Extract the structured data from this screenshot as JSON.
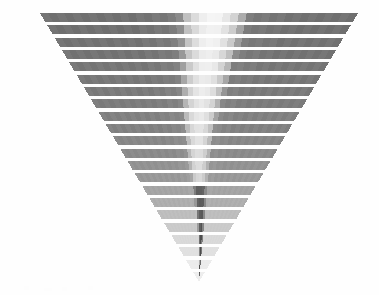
{
  "figure": {
    "title": "",
    "background_color": "#fefefe",
    "width": 379,
    "height": 295
  },
  "chart_data": {
    "type": "heatmap",
    "title": "",
    "subtitle": "",
    "xlabel": "",
    "ylabel": "",
    "grid": false,
    "legend": null,
    "legend_position": "none",
    "geometry": {
      "shape": "inverted-triangle",
      "apex_x": 199,
      "apex_y": 282,
      "top_left_x": 40,
      "top_right_x": 358,
      "top_y": 13,
      "row_count": 22,
      "row_pitch": 12.3,
      "row_fill_ratio": 0.7,
      "cells_per_row": 40
    },
    "curve": {
      "name": "light-sweep-band",
      "description": "Light low-value band curving from upper-centre to the apex",
      "control_points": [
        [
          0.0,
          0.545,
          0.115
        ],
        [
          0.12,
          0.535,
          0.11
        ],
        [
          0.25,
          0.512,
          0.1
        ],
        [
          0.38,
          0.498,
          0.09
        ],
        [
          0.5,
          0.497,
          0.078
        ],
        [
          0.62,
          0.505,
          0.066
        ],
        [
          0.74,
          0.52,
          0.055
        ],
        [
          0.86,
          0.535,
          0.045
        ],
        [
          1.0,
          0.548,
          0.038
        ]
      ]
    },
    "colors": {
      "background": "#fefefe",
      "gap": "#ffffff",
      "base_high": "#707070",
      "base_mid": "#8d8d8d",
      "base_low": "#c9c9c9",
      "base_lowest": "#e4e4e4",
      "sweep_light": "#f2f2f2",
      "sweep_lighter": "#fafafa",
      "core_dark": "#5a5a5a",
      "core_darkest": "#4a4a4a"
    },
    "rows": [
      {
        "index": 0,
        "y": 13,
        "value": 0.82,
        "color": "#6f6f6f",
        "sweep_center": 0.545,
        "sweep_half_width": 0.115,
        "sweep_value": 0.05
      },
      {
        "index": 1,
        "y": 25,
        "value": 0.82,
        "color": "#6f6f6f",
        "sweep_center": 0.543,
        "sweep_half_width": 0.114,
        "sweep_value": 0.06
      },
      {
        "index": 2,
        "y": 38,
        "value": 0.81,
        "color": "#717171",
        "sweep_center": 0.54,
        "sweep_half_width": 0.112,
        "sweep_value": 0.08
      },
      {
        "index": 3,
        "y": 50,
        "value": 0.81,
        "color": "#727272",
        "sweep_center": 0.535,
        "sweep_half_width": 0.11,
        "sweep_value": 0.1
      },
      {
        "index": 4,
        "y": 62,
        "value": 0.8,
        "color": "#747474",
        "sweep_center": 0.53,
        "sweep_half_width": 0.107,
        "sweep_value": 0.12
      },
      {
        "index": 5,
        "y": 75,
        "value": 0.79,
        "color": "#767676",
        "sweep_center": 0.524,
        "sweep_half_width": 0.104,
        "sweep_value": 0.14
      },
      {
        "index": 6,
        "y": 87,
        "value": 0.78,
        "color": "#787878",
        "sweep_center": 0.518,
        "sweep_half_width": 0.101,
        "sweep_value": 0.16
      },
      {
        "index": 7,
        "y": 99,
        "value": 0.77,
        "color": "#7b7b7b",
        "sweep_center": 0.512,
        "sweep_half_width": 0.098,
        "sweep_value": 0.18
      },
      {
        "index": 8,
        "y": 112,
        "value": 0.76,
        "color": "#7e7e7e",
        "sweep_center": 0.506,
        "sweep_half_width": 0.094,
        "sweep_value": 0.21
      },
      {
        "index": 9,
        "y": 124,
        "value": 0.74,
        "color": "#818181",
        "sweep_center": 0.501,
        "sweep_half_width": 0.09,
        "sweep_value": 0.24
      },
      {
        "index": 10,
        "y": 136,
        "value": 0.72,
        "color": "#858585",
        "sweep_center": 0.498,
        "sweep_half_width": 0.086,
        "sweep_value": 0.28
      },
      {
        "index": 11,
        "y": 149,
        "value": 0.7,
        "color": "#8a8a8a",
        "sweep_center": 0.497,
        "sweep_half_width": 0.081,
        "sweep_value": 0.33
      },
      {
        "index": 12,
        "y": 161,
        "value": 0.67,
        "color": "#909090",
        "sweep_center": 0.498,
        "sweep_half_width": 0.076,
        "sweep_value": 0.4
      },
      {
        "index": 13,
        "y": 173,
        "value": 0.63,
        "color": "#989898",
        "sweep_center": 0.502,
        "sweep_half_width": 0.07,
        "sweep_value": 0.48
      },
      {
        "index": 14,
        "y": 186,
        "value": 0.58,
        "color": "#a2a2a2",
        "sweep_center": 0.508,
        "sweep_half_width": 0.064,
        "sweep_value": 0.58
      },
      {
        "index": 15,
        "y": 198,
        "value": 0.52,
        "color": "#aeaeae",
        "sweep_center": 0.515,
        "sweep_half_width": 0.058,
        "sweep_value": 0.68
      },
      {
        "index": 16,
        "y": 210,
        "value": 0.45,
        "color": "#bcbcbc",
        "sweep_center": 0.522,
        "sweep_half_width": 0.053,
        "sweep_value": 0.78
      },
      {
        "index": 17,
        "y": 223,
        "value": 0.37,
        "color": "#cbcbcb",
        "sweep_center": 0.529,
        "sweep_half_width": 0.048,
        "sweep_value": 0.86
      },
      {
        "index": 18,
        "y": 235,
        "value": 0.29,
        "color": "#d8d8d8",
        "sweep_center": 0.535,
        "sweep_half_width": 0.044,
        "sweep_value": 0.9
      },
      {
        "index": 19,
        "y": 247,
        "value": 0.22,
        "color": "#e3e3e3",
        "sweep_center": 0.54,
        "sweep_half_width": 0.041,
        "sweep_value": 0.92
      },
      {
        "index": 20,
        "y": 260,
        "value": 0.16,
        "color": "#ebebeb",
        "sweep_center": 0.545,
        "sweep_half_width": 0.039,
        "sweep_value": 0.93
      },
      {
        "index": 21,
        "y": 272,
        "value": 0.12,
        "color": "#f0f0f0",
        "sweep_center": 0.548,
        "sweep_half_width": 0.038,
        "sweep_value": 0.94
      }
    ]
  }
}
